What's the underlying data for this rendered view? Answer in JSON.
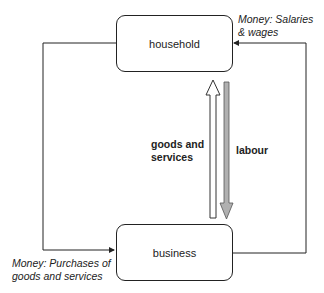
{
  "nodes": {
    "household": "household",
    "business": "business"
  },
  "flows": {
    "salaries_line1": "Money: Salaries",
    "salaries_line2": "& wages",
    "purchases_line1": "Money: Purchases of",
    "purchases_line2": "goods and services",
    "goods_line1": "goods and",
    "goods_line2": "services",
    "labour": "labour"
  },
  "colors": {
    "line": "#222222",
    "labour_arrow": "#b0b0b0",
    "goods_arrow": "#ffffff"
  }
}
